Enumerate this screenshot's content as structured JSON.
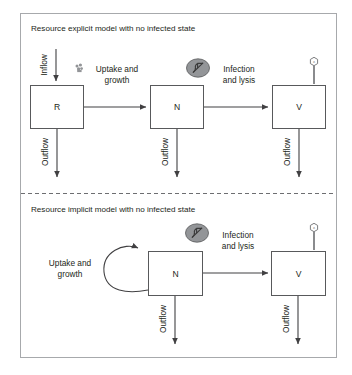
{
  "figure": {
    "panels": [
      {
        "id": "top-panel",
        "title": "Resource explicit model with no infected state",
        "boxes": [
          {
            "id": "box-r",
            "label": "R"
          },
          {
            "id": "box-n",
            "label": "N"
          },
          {
            "id": "box-v",
            "label": "V"
          }
        ],
        "flows": [
          {
            "id": "inflow-r",
            "label": "Inflow",
            "orientation": "vertical"
          },
          {
            "id": "uptake-growth",
            "label_line1": "Uptake and",
            "label_line2": "growth",
            "orientation": "horizontal"
          },
          {
            "id": "infection-lysis",
            "label_line1": "Infection",
            "label_line2": "and lysis",
            "orientation": "horizontal"
          },
          {
            "id": "outflow-r",
            "label": "Outflow",
            "orientation": "vertical"
          },
          {
            "id": "outflow-n",
            "label": "Outflow",
            "orientation": "vertical"
          },
          {
            "id": "outflow-v",
            "label": "Outflow",
            "orientation": "vertical"
          }
        ],
        "icons": [
          {
            "id": "resource-icon",
            "name": "resource-particle-icon"
          },
          {
            "id": "bacteria-icon",
            "name": "bacteria-icon"
          },
          {
            "id": "phage-icon",
            "name": "bacteriophage-icon"
          }
        ]
      },
      {
        "id": "bottom-panel",
        "title": "Resource implicit model with no infected state",
        "boxes": [
          {
            "id": "box-n2",
            "label": "N"
          },
          {
            "id": "box-v2",
            "label": "V"
          }
        ],
        "flows": [
          {
            "id": "uptake-growth-loop",
            "label_line1": "Uptake and",
            "label_line2": "growth",
            "orientation": "self-loop"
          },
          {
            "id": "infection-lysis-2",
            "label_line1": "Infection",
            "label_line2": "and lysis",
            "orientation": "horizontal"
          },
          {
            "id": "outflow-n2",
            "label": "Outflow",
            "orientation": "vertical"
          },
          {
            "id": "outflow-v2",
            "label": "Outflow",
            "orientation": "vertical"
          }
        ],
        "icons": [
          {
            "id": "bacteria-icon-2",
            "name": "bacteria-icon"
          },
          {
            "id": "phage-icon-2",
            "name": "bacteriophage-icon"
          }
        ]
      }
    ],
    "phage_glyph": "z",
    "colors": {
      "frame_stroke": "#a7a9ac",
      "box_stroke": "#58595b",
      "line": "#414042",
      "microbe_fill": "#939598",
      "text": "#231f20",
      "caption": "#8e8e8e",
      "background": "#ffffff"
    }
  }
}
